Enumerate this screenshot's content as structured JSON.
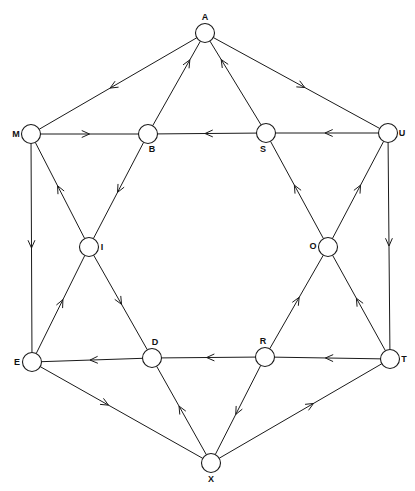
{
  "diagram": {
    "background_color": "#ffffff",
    "stroke_color": "#1a1a1a",
    "node_fill_color": "#ffffff",
    "node_radius": 9.5,
    "width": 415,
    "height": 491,
    "footer_note": ""
  },
  "chart_data": {
    "type": "diagram",
    "graph_type": "directed",
    "node_count": 12,
    "edge_count": 24,
    "nodes": [
      {
        "id": "A",
        "label": "A",
        "x": 205,
        "y": 33,
        "label_dx": 0,
        "label_dy": -13,
        "anchor": "middle"
      },
      {
        "id": "M",
        "label": "M",
        "x": 31,
        "y": 134,
        "label_dx": -15,
        "label_dy": 3,
        "anchor": "middle"
      },
      {
        "id": "B",
        "label": "B",
        "x": 148,
        "y": 134,
        "label_dx": 4,
        "label_dy": 18,
        "anchor": "middle"
      },
      {
        "id": "S",
        "label": "S",
        "x": 266,
        "y": 133,
        "label_dx": -3,
        "label_dy": 19,
        "anchor": "middle"
      },
      {
        "id": "U",
        "label": "U",
        "x": 388,
        "y": 133,
        "label_dx": 14,
        "label_dy": 3,
        "anchor": "middle"
      },
      {
        "id": "I",
        "label": "I",
        "x": 89,
        "y": 247,
        "label_dx": 13,
        "label_dy": 3,
        "anchor": "middle"
      },
      {
        "id": "O",
        "label": "O",
        "x": 328,
        "y": 247,
        "label_dx": -15,
        "label_dy": 2,
        "anchor": "middle"
      },
      {
        "id": "E",
        "label": "E",
        "x": 32,
        "y": 362,
        "label_dx": -15,
        "label_dy": 3,
        "anchor": "middle"
      },
      {
        "id": "D",
        "label": "D",
        "x": 152,
        "y": 358,
        "label_dx": 3,
        "label_dy": -13,
        "anchor": "middle"
      },
      {
        "id": "R",
        "label": "R",
        "x": 265,
        "y": 357,
        "label_dx": -2,
        "label_dy": -13,
        "anchor": "middle"
      },
      {
        "id": "T",
        "label": "T",
        "x": 390,
        "y": 359,
        "label_dx": 14,
        "label_dy": 3,
        "anchor": "middle"
      },
      {
        "id": "X",
        "label": "X",
        "x": 211,
        "y": 463,
        "label_dx": 0,
        "label_dy": 19,
        "anchor": "middle"
      }
    ],
    "edges": [
      {
        "from": "A",
        "to": "M",
        "arrow_at": 0.55
      },
      {
        "from": "A",
        "to": "U",
        "arrow_at": 0.55
      },
      {
        "from": "B",
        "to": "A",
        "arrow_at": 0.78
      },
      {
        "from": "S",
        "to": "A",
        "arrow_at": 0.78
      },
      {
        "from": "M",
        "to": "B",
        "arrow_at": 0.5
      },
      {
        "from": "S",
        "to": "B",
        "arrow_at": 0.52
      },
      {
        "from": "U",
        "to": "S",
        "arrow_at": 0.52
      },
      {
        "from": "M",
        "to": "E",
        "arrow_at": 0.5
      },
      {
        "from": "U",
        "to": "T",
        "arrow_at": 0.5
      },
      {
        "from": "B",
        "to": "I",
        "arrow_at": 0.52
      },
      {
        "from": "I",
        "to": "M",
        "arrow_at": 0.55
      },
      {
        "from": "O",
        "to": "S",
        "arrow_at": 0.55
      },
      {
        "from": "O",
        "to": "U",
        "arrow_at": 0.55
      },
      {
        "from": "E",
        "to": "I",
        "arrow_at": 0.55
      },
      {
        "from": "I",
        "to": "D",
        "arrow_at": 0.52
      },
      {
        "from": "D",
        "to": "E",
        "arrow_at": 0.52
      },
      {
        "from": "R",
        "to": "O",
        "arrow_at": 0.55
      },
      {
        "from": "T",
        "to": "O",
        "arrow_at": 0.55
      },
      {
        "from": "T",
        "to": "R",
        "arrow_at": 0.52
      },
      {
        "from": "R",
        "to": "D",
        "arrow_at": 0.52
      },
      {
        "from": "E",
        "to": "X",
        "arrow_at": 0.42
      },
      {
        "from": "X",
        "to": "D",
        "arrow_at": 0.55
      },
      {
        "from": "R",
        "to": "X",
        "arrow_at": 0.55
      },
      {
        "from": "X",
        "to": "T",
        "arrow_at": 0.58
      }
    ],
    "title": "",
    "xlabel": "",
    "ylabel": ""
  }
}
